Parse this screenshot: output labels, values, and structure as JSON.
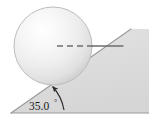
{
  "figure": {
    "background_color": "#ffffff",
    "width": 149,
    "height": 124,
    "angle_label": "35.0",
    "angle_degree_symbol": "°",
    "incline": {
      "name": "inclined-plane",
      "angle_degrees": 35.0,
      "fill_color": "#dcdcdc",
      "edge_color": "#8c8c8c",
      "vertex_left": [
        11,
        113
      ],
      "vertex_apex": [
        131,
        29
      ],
      "vertex_right": [
        149,
        113
      ]
    },
    "sphere": {
      "name": "sphere",
      "center": [
        53,
        46
      ],
      "radius": 39,
      "fill_light": "#fcfcfc",
      "fill_mid": "#ededed",
      "fill_dark": "#cfcfcf",
      "edge_color": "#b4b4b4"
    },
    "center_line": {
      "name": "center-axis-line",
      "style_dashed": "dashed",
      "style_solid": "solid",
      "color": "#6e6e6e",
      "dash_start": [
        57,
        46
      ],
      "dash_end": [
        92,
        46
      ],
      "solid_end": [
        123,
        46
      ]
    },
    "angle_arc": {
      "name": "angle-arc-arrow",
      "color": "#2b2b2b",
      "arrow_tip": [
        52,
        85
      ]
    },
    "baseline": {
      "name": "ground-baseline",
      "color": "#8c8c8c",
      "y": 113
    }
  }
}
